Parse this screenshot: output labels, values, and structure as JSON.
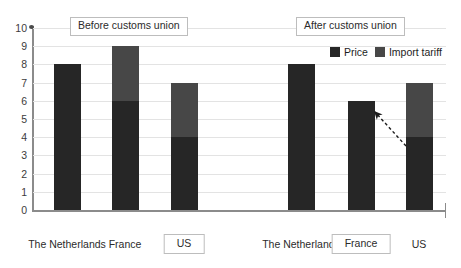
{
  "chart_data": {
    "type": "bar",
    "stacked": true,
    "title": "",
    "xlabel": "",
    "ylabel": "",
    "ylim": [
      0,
      10
    ],
    "ytick_labels": [
      "10",
      "9",
      "8",
      "7",
      "6",
      "5",
      "4",
      "3",
      "2",
      "1",
      "0"
    ],
    "grid": true,
    "legend_position": "top-right",
    "series": [
      {
        "name": "Price",
        "color": "#262626",
        "values": [
          8,
          6,
          4,
          8,
          6,
          4
        ]
      },
      {
        "name": "Import tariff",
        "color": "#474747",
        "values": [
          0,
          3,
          3,
          0,
          0,
          3
        ]
      }
    ],
    "categories": [
      "The Netherlands",
      "France",
      "US",
      "The Netherlands",
      "France",
      "US"
    ],
    "totals": [
      8,
      9,
      7,
      8,
      6,
      7
    ],
    "groups": [
      {
        "label": "Before customs union",
        "categories": [
          "The Netherlands",
          "France",
          "US"
        ]
      },
      {
        "label": "After customs union",
        "categories": [
          "The Netherlands",
          "France",
          "US"
        ]
      }
    ],
    "highlighted_categories": [
      "US (before)",
      "France (after)"
    ],
    "annotation": {
      "type": "dashed-arrow",
      "from": "US (after) price/tariff boundary at 4",
      "to": "France (after) bar top at 6"
    }
  },
  "sections": {
    "before": {
      "label": "Before customs union"
    },
    "after": {
      "label": "After customs union"
    }
  },
  "legend": {
    "items": [
      {
        "label": "Price",
        "color": "#262626"
      },
      {
        "label": "Import tariff",
        "color": "#474747"
      }
    ]
  },
  "axis": {
    "y_ticks": [
      "10",
      "9",
      "8",
      "7",
      "6",
      "5",
      "4",
      "3",
      "2",
      "1",
      "0"
    ]
  },
  "categories": [
    {
      "label": "The Netherlands",
      "boxed": false
    },
    {
      "label": "France",
      "boxed": false
    },
    {
      "label": "US",
      "boxed": true
    },
    {
      "label": "The Netherlands",
      "boxed": false
    },
    {
      "label": "France",
      "boxed": true
    },
    {
      "label": "US",
      "boxed": false
    }
  ],
  "colors": {
    "price": "#262626",
    "tariff": "#474747",
    "grid": "#e3e3e3",
    "axis": "#8b8b8b",
    "box_border": "#bdbdbd",
    "text": "#2b2b2b"
  }
}
